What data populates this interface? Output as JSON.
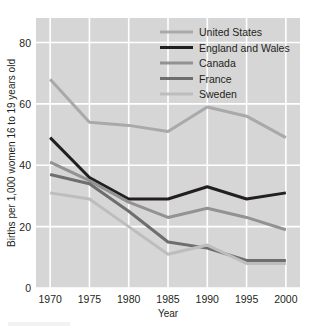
{
  "chart_data": {
    "type": "line",
    "title": "",
    "xlabel": "Year",
    "ylabel": "Births per 1,000 women 16 to 19 years old",
    "x": [
      1970,
      1975,
      1980,
      1985,
      1990,
      1995,
      2000
    ],
    "xtick_labels": [
      "1970",
      "1975",
      "1980",
      "1985",
      "1990",
      "1995",
      "2000"
    ],
    "ytick_labels": [
      "0",
      "20",
      "40",
      "60",
      "80"
    ],
    "yticks": [
      0,
      20,
      40,
      60,
      80
    ],
    "ylim": [
      0,
      88
    ],
    "xlim": [
      1968.2,
      2001.8
    ],
    "grid": true,
    "grid_color": "#ffffff",
    "plot_background": "#d6d6d6",
    "legend_position": "top-right-inside",
    "series": [
      {
        "name": "United States",
        "color": "#a9a9a9",
        "width": 3.0,
        "values": [
          68,
          54,
          53,
          51,
          59,
          56,
          49
        ]
      },
      {
        "name": "England and Wales",
        "color": "#231f20",
        "width": 3.0,
        "values": [
          49,
          36,
          29,
          29,
          33,
          29,
          31
        ]
      },
      {
        "name": "Canada",
        "color": "#929292",
        "width": 3.0,
        "values": [
          41,
          35,
          28,
          23,
          26,
          23,
          19
        ]
      },
      {
        "name": "France",
        "color": "#6e6e6e",
        "width": 3.0,
        "values": [
          37,
          34,
          25,
          15,
          13,
          9,
          9
        ]
      },
      {
        "name": "Sweden",
        "color": "#bdbdbd",
        "width": 3.0,
        "values": [
          31,
          29,
          20,
          11,
          14,
          8,
          8
        ]
      }
    ]
  },
  "legend": {
    "entries": [
      {
        "label": "United States"
      },
      {
        "label": "England and Wales"
      },
      {
        "label": "Canada"
      },
      {
        "label": "France"
      },
      {
        "label": "Sweden"
      }
    ]
  },
  "axes": {
    "y_title": "Births per 1,000 women 16 to 19 years old",
    "x_title": "Year"
  }
}
